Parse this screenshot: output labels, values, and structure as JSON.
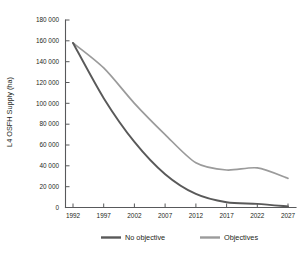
{
  "chart_data": {
    "type": "line",
    "title": "",
    "xlabel": "",
    "ylabel": "L4 OSFH Supply (ha)",
    "x": [
      1992,
      1997,
      2002,
      2007,
      2012,
      2017,
      2022,
      2027
    ],
    "xtick_labels": [
      "1992",
      "1997",
      "2002",
      "2007",
      "2012",
      "2017",
      "2022",
      "2027"
    ],
    "xlim": [
      1992,
      2027
    ],
    "ylim": [
      0,
      180000
    ],
    "ytick_labels": [
      "0",
      "20 000",
      "40 000",
      "60 000",
      "80 000",
      "100 000",
      "120 000",
      "140 000",
      "160 000",
      "180 000"
    ],
    "ytick_values": [
      0,
      20000,
      40000,
      60000,
      80000,
      100000,
      120000,
      140000,
      160000,
      180000
    ],
    "grid": false,
    "legend_position": "bottom",
    "series": [
      {
        "name": "No objective",
        "color": "#595959",
        "values": [
          158000,
          105000,
          63000,
          32000,
          13000,
          5000,
          3500,
          1000
        ]
      },
      {
        "name": "Objectives",
        "color": "#9b9b9b",
        "values": [
          158000,
          134000,
          100000,
          70000,
          43000,
          36000,
          38000,
          28000
        ]
      }
    ]
  },
  "axis": {
    "y_title": "L4 OSFH Supply (ha)"
  },
  "legend": {
    "items": [
      {
        "label": "No objective",
        "color": "#595959"
      },
      {
        "label": "Objectives",
        "color": "#9b9b9b"
      }
    ]
  },
  "caption": {
    "text": ""
  }
}
